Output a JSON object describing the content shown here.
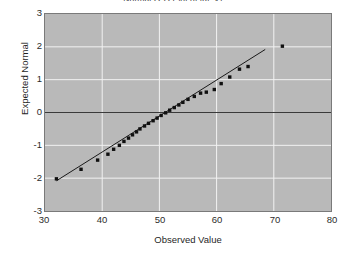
{
  "chart_data": {
    "type": "scatter",
    "title": "Normal Q-Q Plot of fat_v1",
    "xlabel": "Observed Value",
    "ylabel": "Expected Normal",
    "xlim": [
      30,
      80
    ],
    "ylim": [
      -3,
      3
    ],
    "xticks": [
      30,
      40,
      50,
      60,
      70,
      80
    ],
    "yticks": [
      3,
      2,
      1,
      0,
      -1,
      -2,
      -3
    ],
    "grid": true,
    "legend": "none",
    "marker": "filled-square",
    "marker_color": "#101010",
    "plot_background": "#b9b9b9",
    "gridline_color": "#f2f2f2",
    "reference_line_color": "#1a1a1a",
    "zero_line_color": "#3a3a3a",
    "series": [
      {
        "name": "fat_v1",
        "x": [
          32.0,
          36.3,
          39.2,
          41.0,
          42.0,
          43.0,
          43.8,
          44.6,
          45.3,
          46.0,
          46.6,
          47.4,
          48.1,
          48.9,
          49.6,
          50.3,
          51.1,
          51.8,
          52.6,
          53.4,
          54.1,
          55.0,
          56.1,
          57.2,
          58.2,
          59.6,
          60.8,
          62.3,
          64.0,
          65.5,
          71.5
        ],
        "y": [
          -2.02,
          -1.73,
          -1.45,
          -1.27,
          -1.12,
          -1.0,
          -0.88,
          -0.78,
          -0.68,
          -0.59,
          -0.5,
          -0.41,
          -0.33,
          -0.25,
          -0.17,
          -0.09,
          -0.01,
          0.07,
          0.15,
          0.23,
          0.31,
          0.4,
          0.49,
          0.59,
          0.62,
          0.7,
          0.88,
          1.08,
          1.32,
          1.4,
          2.02
        ]
      }
    ],
    "reference_line": {
      "x1": 32.0,
      "y1": -2.08,
      "x2": 68.5,
      "y2": 1.92
    },
    "zero_line": {
      "y": 0
    }
  },
  "axis": {
    "y_ticks": [
      "3",
      "2",
      "1",
      "0",
      "-1",
      "-2",
      "-3"
    ],
    "x_ticks": [
      "30",
      "40",
      "50",
      "60",
      "70",
      "80"
    ],
    "y_title": "Expected Normal",
    "x_title": "Observed Value"
  },
  "header": {
    "title": "Normal Q-Q Plot of fat_v1"
  }
}
